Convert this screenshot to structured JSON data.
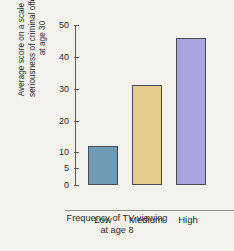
{
  "chart_data": {
    "type": "bar",
    "title": "",
    "categories": [
      "Low",
      "Medium",
      "High"
    ],
    "values": [
      12,
      31,
      46
    ],
    "xlabel": "Frequency of TV viewing\nat age 8",
    "ylabel": "Average score on a scale of the\nseriousness of criminal offenses\nat age 30",
    "ylim": [
      0,
      50
    ],
    "yticks": [
      0,
      5,
      10,
      20,
      30,
      40,
      50
    ],
    "ytick_labels": [
      "0",
      "5",
      "10",
      "20",
      "30",
      "40",
      "50"
    ],
    "grid": false,
    "legend": null,
    "axis_note": "y-axis has non-uniform spacing: 0-5-10 compressed, then 10-20-30-40-50",
    "bar_colors": [
      "#6e9cb5",
      "#e3cc8d",
      "#a9a6dd"
    ],
    "bar_edge_color": "#4a4a52",
    "background_color": "#f4f2ec",
    "axis_color": "#5a5a5a",
    "text_color": "#2b2b2b"
  },
  "axes": {
    "y_tick_0": "0",
    "y_tick_1": "5",
    "y_tick_2": "10",
    "y_tick_3": "20",
    "y_tick_4": "30",
    "y_tick_5": "40",
    "y_tick_6": "50"
  }
}
